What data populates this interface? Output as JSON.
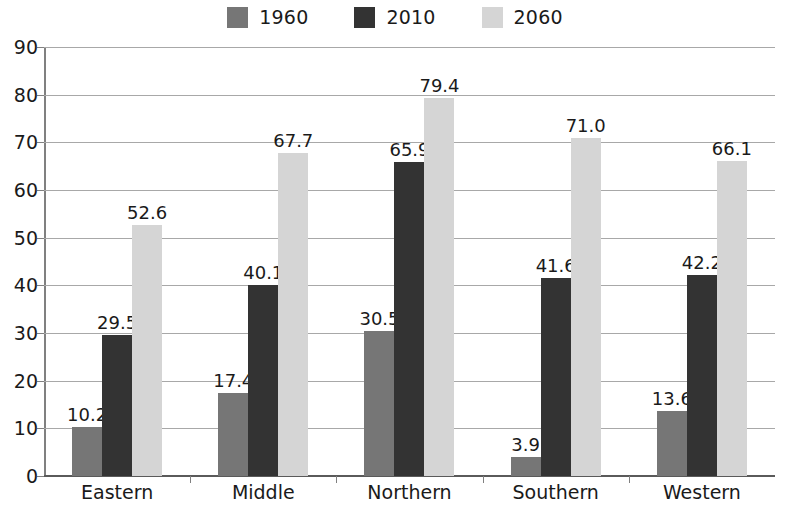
{
  "chart_data": {
    "type": "bar",
    "title": "",
    "subtitle": "",
    "xlabel": "",
    "ylabel": "",
    "categories": [
      "Eastern",
      "Middle",
      "Northern",
      "Southern",
      "Western"
    ],
    "series": [
      {
        "name": "1960",
        "color": "#767676",
        "values": [
          10.2,
          17.4,
          30.5,
          3.9,
          13.6
        ]
      },
      {
        "name": "2010",
        "color": "#333333",
        "values": [
          29.5,
          40.1,
          65.9,
          41.6,
          42.2
        ]
      },
      {
        "name": "2060",
        "color": "#d5d5d5",
        "values": [
          52.6,
          67.7,
          79.4,
          71.0,
          66.1
        ]
      }
    ],
    "value_labels": [
      [
        "10.2",
        "29.5",
        "52.6"
      ],
      [
        "17.4",
        "40.1",
        "67.7"
      ],
      [
        "30.5",
        "65.9",
        "79.4"
      ],
      [
        "3.9",
        "41.6",
        "71.0"
      ],
      [
        "13.6",
        "42.2",
        "66.1"
      ]
    ],
    "ylim": [
      0,
      90
    ],
    "yticks": [
      0,
      10,
      20,
      30,
      40,
      50,
      60,
      70,
      80,
      90
    ],
    "ytick_labels": [
      "0",
      "10",
      "20",
      "30",
      "40",
      "50",
      "60",
      "70",
      "80",
      "90"
    ],
    "grid": true,
    "legend_position": "top-center",
    "legend_entries": [
      "1960",
      "2010",
      "2060"
    ]
  }
}
